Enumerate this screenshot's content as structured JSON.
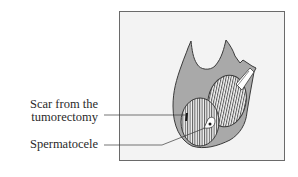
{
  "figure": {
    "labels": {
      "scar_line1": "Scar from the",
      "scar_line2": "tumorectomy",
      "spermatocele": "Spermatocele"
    },
    "colors": {
      "frame_fill": "#f3f3f3",
      "frame_border": "#6a6a6a",
      "organ_fill": "#a9a9a9",
      "outline": "#3a3a3a",
      "hatch": "#555555",
      "text": "#2a2a2a"
    }
  }
}
